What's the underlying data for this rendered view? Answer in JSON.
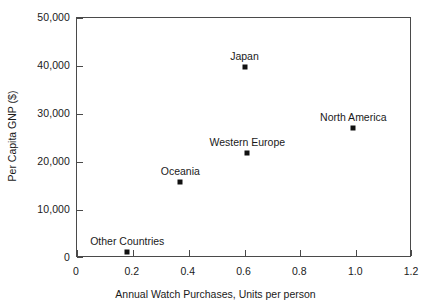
{
  "chart_data": {
    "type": "scatter",
    "title": "",
    "xlabel": "Annual Watch Purchases, Units per person",
    "ylabel": "Per Capita GNP ($)",
    "xlim": [
      0,
      1.2
    ],
    "ylim": [
      0,
      50000
    ],
    "grid": false,
    "legend": "none",
    "xticks": [
      "0",
      "0.2",
      "0.4",
      "0.6",
      "0.8",
      "1.0",
      "1.2"
    ],
    "xtick_values": [
      0,
      0.2,
      0.4,
      0.6,
      0.8,
      1.0,
      1.2
    ],
    "yticks": [
      "0",
      "10,000",
      "20,000",
      "30,000",
      "40,000",
      "50,000"
    ],
    "ytick_values": [
      0,
      10000,
      20000,
      30000,
      40000,
      50000
    ],
    "points": [
      {
        "label": "Other Countries",
        "x": 0.18,
        "y": 1300
      },
      {
        "label": "Oceania",
        "x": 0.37,
        "y": 15900
      },
      {
        "label": "Western Europe",
        "x": 0.61,
        "y": 21900
      },
      {
        "label": "Japan",
        "x": 0.6,
        "y": 39700
      },
      {
        "label": "North America",
        "x": 0.99,
        "y": 27100
      }
    ],
    "marker": "square",
    "marker_color": "#111111",
    "axis_color": "#4a4a4a",
    "background_color": "#ffffff"
  }
}
